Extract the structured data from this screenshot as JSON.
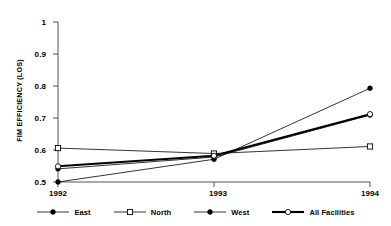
{
  "chart_data": {
    "type": "line",
    "title": "",
    "xlabel": "",
    "ylabel": "FIM EFFICIENCY (LOS)",
    "categories": [
      "1992",
      "1993",
      "1994"
    ],
    "x": [
      1992,
      1993,
      1994
    ],
    "ylim": [
      0.5,
      1
    ],
    "xlim": [
      1992,
      1994
    ],
    "ytick_labels": [
      "0.5",
      "0.6",
      "0.7",
      "0.8",
      "0.9",
      "1"
    ],
    "yticks": [
      0.5,
      0.6,
      0.7,
      0.8,
      0.9,
      1
    ],
    "grid": false,
    "legend_position": "bottom",
    "series": [
      {
        "name": "East",
        "values": [
          0.5,
          0.571,
          0.793
        ],
        "marker": "filled-circle",
        "line_width": "thin",
        "color": "#000000"
      },
      {
        "name": "North",
        "values": [
          0.606,
          0.589,
          0.611
        ],
        "marker": "open-square",
        "line_width": "thin",
        "color": "#000000"
      },
      {
        "name": "West",
        "values": [
          0.541,
          0.578,
          0.709
        ],
        "marker": "filled-circle",
        "line_width": "thin",
        "color": "#000000"
      },
      {
        "name": "All Facilities",
        "values": [
          0.549,
          0.582,
          0.712
        ],
        "marker": "open-circle",
        "line_width": "thick",
        "color": "#000000"
      }
    ]
  },
  "axis": {
    "y_title": "FIM EFFICIENCY (LOS)",
    "y_labels": [
      "1",
      "0.9",
      "0.8",
      "0.7",
      "0.6",
      "0.5"
    ],
    "x_labels": [
      "1992",
      "1993",
      "1994"
    ]
  },
  "legend": {
    "items": [
      {
        "label": "East",
        "marker": "filled-circle-icon"
      },
      {
        "label": "North",
        "marker": "open-square-icon"
      },
      {
        "label": "West",
        "marker": "filled-circle-icon"
      },
      {
        "label": "All Facilities",
        "marker": "open-circle-icon"
      }
    ]
  }
}
